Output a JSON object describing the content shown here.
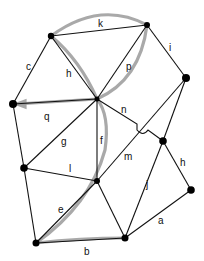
{
  "diagram": {
    "type": "graph",
    "vertices": [
      {
        "id": "A",
        "x": 51,
        "y": 36,
        "r": 3.2
      },
      {
        "id": "B",
        "x": 147,
        "y": 25,
        "r": 3
      },
      {
        "id": "C",
        "x": 186,
        "y": 78,
        "r": 4
      },
      {
        "id": "D",
        "x": 13,
        "y": 104,
        "r": 4
      },
      {
        "id": "E",
        "x": 97,
        "y": 99,
        "r": 2.5
      },
      {
        "id": "F",
        "x": 163,
        "y": 141,
        "r": 3.8
      },
      {
        "id": "G",
        "x": 24,
        "y": 168,
        "r": 3.8
      },
      {
        "id": "H",
        "x": 97,
        "y": 181,
        "r": 3
      },
      {
        "id": "I",
        "x": 191,
        "y": 190,
        "r": 3.8
      },
      {
        "id": "J",
        "x": 36,
        "y": 243,
        "r": 3.5
      },
      {
        "id": "K",
        "x": 125,
        "y": 238,
        "r": 3.5
      }
    ],
    "edges": [
      {
        "label": "k",
        "from": "A",
        "to": "B"
      },
      {
        "label": "c",
        "from": "A",
        "to": "D"
      },
      {
        "label": "h",
        "from": "A",
        "to": "E"
      },
      {
        "label": "p",
        "from": "B",
        "to": "E"
      },
      {
        "label": "i",
        "from": "B",
        "to": "C"
      },
      {
        "label": "q",
        "from": "D",
        "to": "E"
      },
      {
        "label": "n",
        "from": "E",
        "to": "F"
      },
      {
        "label": "m",
        "from": "C",
        "to": "H"
      },
      {
        "label": "f",
        "from": "E",
        "to": "H"
      },
      {
        "label": "g",
        "from": "E",
        "to": "G"
      },
      {
        "label": "l",
        "from": "G",
        "to": "H"
      },
      {
        "label": "e",
        "from": "H",
        "to": "J"
      },
      {
        "label": "b",
        "from": "J",
        "to": "K"
      },
      {
        "label": "j",
        "from": "F",
        "to": "K"
      },
      {
        "label": "h",
        "from": "F",
        "to": "I"
      },
      {
        "label": "a",
        "from": "I",
        "to": "K"
      },
      {
        "label": "",
        "from": "D",
        "to": "G"
      },
      {
        "label": "",
        "from": "G",
        "to": "J"
      },
      {
        "label": "",
        "from": "H",
        "to": "K"
      },
      {
        "label": "",
        "from": "C",
        "to": "F"
      }
    ],
    "highlighted_path": [
      "J",
      "K",
      "H",
      "E",
      "B",
      "A",
      "E",
      "D"
    ],
    "labels": {
      "k": "k",
      "c": "c",
      "h1": "h",
      "p": "p",
      "i": "i",
      "q": "q",
      "n": "n",
      "m": "m",
      "f": "f",
      "g": "g",
      "l": "l",
      "e": "e",
      "b": "b",
      "j": "j",
      "h2": "h",
      "a": "a"
    },
    "colors": {
      "edge": "#111111",
      "highlight": "#9a9a9a",
      "node": "#000000"
    }
  }
}
